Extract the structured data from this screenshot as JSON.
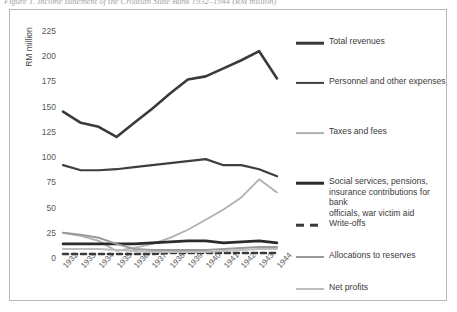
{
  "caption": "Figure 1. Income statement of the Croatian State Bank 1932–1944 (RM million)",
  "axis": {
    "y_title": "RM million",
    "y_ticks": [
      "225",
      "200",
      "175",
      "150",
      "125",
      "100",
      "75",
      "50",
      "25",
      "0"
    ],
    "x_ticks": [
      "1932",
      "1933",
      "1934",
      "1935",
      "1936",
      "1937",
      "1938",
      "1939",
      "1940",
      "1941",
      "1942",
      "1943",
      "1944"
    ]
  },
  "legend": {
    "items": [
      {
        "label": "Total revenues",
        "color": "#3a3a3a",
        "width": 2.6,
        "dashed": false
      },
      {
        "label": "Personnel and other expenses",
        "color": "#3f3f3f",
        "width": 2.2,
        "dashed": false
      },
      {
        "label": "Taxes and fees",
        "color": "#b0b0b0",
        "width": 1.8,
        "dashed": false
      },
      {
        "label": "Social services, pensions,\ninsurance contributions for bank\nofficials, war victim aid",
        "color": "#2b2b2b",
        "width": 2.6,
        "dashed": false
      },
      {
        "label": "Write-offs",
        "color": "#3a3a3a",
        "width": 2.6,
        "dashed": true
      },
      {
        "label": "Allocations to reserves",
        "color": "#9a9a9a",
        "width": 2.0,
        "dashed": false
      },
      {
        "label": "Net profits",
        "color": "#bdbdbd",
        "width": 2.0,
        "dashed": false
      }
    ]
  },
  "chart_data": {
    "type": "line",
    "title": "Income statement of the Croatian State Bank 1932–1944",
    "xlabel": "",
    "ylabel": "RM million",
    "ylim": [
      0,
      225
    ],
    "grid": false,
    "legend_position": "right",
    "x": [
      "1932",
      "1933",
      "1934",
      "1935",
      "1936",
      "1937",
      "1938",
      "1939",
      "1940",
      "1941",
      "1942",
      "1943",
      "1944"
    ],
    "series": [
      {
        "name": "Total revenues",
        "color": "#3a3a3a",
        "values": [
          145,
          134,
          130,
          120,
          134,
          148,
          163,
          177,
          180,
          188,
          196,
          205,
          178
        ]
      },
      {
        "name": "Personnel and other expenses",
        "color": "#3f3f3f",
        "values": [
          92,
          87,
          87,
          88,
          90,
          92,
          94,
          96,
          98,
          92,
          92,
          88,
          81
        ]
      },
      {
        "name": "Taxes and fees",
        "color": "#b0b0b0",
        "values": [
          25,
          22,
          17,
          7,
          10,
          14,
          20,
          28,
          38,
          48,
          60,
          78,
          65
        ]
      },
      {
        "name": "Social services, pensions, insurance contributions for bank officials, war victim aid",
        "color": "#2b2b2b",
        "values": [
          14,
          14,
          14,
          14,
          14,
          15,
          16,
          17,
          17,
          15,
          16,
          17,
          15
        ]
      },
      {
        "name": "Write-offs",
        "color": "#3a3a3a",
        "dashed": true,
        "values": [
          4,
          4,
          4,
          4,
          4,
          4,
          5,
          5,
          5,
          5,
          5,
          5,
          5
        ]
      },
      {
        "name": "Allocations to reserves",
        "color": "#9a9a9a",
        "values": [
          25,
          23,
          20,
          14,
          9,
          8,
          8,
          8,
          8,
          9,
          10,
          11,
          11
        ]
      },
      {
        "name": "Net profits",
        "color": "#bdbdbd",
        "values": [
          9,
          9,
          9,
          8,
          7,
          6,
          6,
          6,
          6,
          7,
          8,
          9,
          9
        ]
      }
    ]
  }
}
